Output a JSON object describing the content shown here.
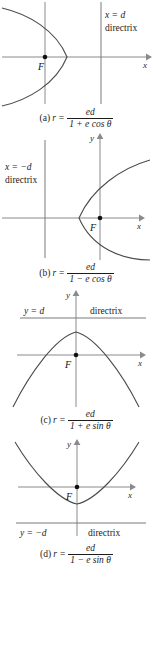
{
  "figure": {
    "axis_color": "#8a8a8a",
    "curve_color": "#4a4a4a",
    "directrix_color": "#7a7a7a",
    "focus_color": "#111111"
  },
  "panels": [
    {
      "id": "a",
      "caption_label": "(a)",
      "caption_var": "r",
      "caption_eq": "=",
      "numerator": "ed",
      "denominator_terms": [
        "1",
        "+",
        "e",
        "cos",
        "θ"
      ],
      "denominator_text": "1 + e cos θ",
      "directrix_label": "x = d",
      "directrix_word": "directrix",
      "focus_label": "F",
      "x_axis_label": "x",
      "y_axis_label": "",
      "curve_type": "parabola-opens-left"
    },
    {
      "id": "b",
      "caption_label": "(b)",
      "caption_var": "r",
      "caption_eq": "=",
      "numerator": "ed",
      "denominator_terms": [
        "1",
        "−",
        "e",
        "cos",
        "θ"
      ],
      "denominator_text": "1 − e cos θ",
      "directrix_label": "x = −d",
      "directrix_word": "directrix",
      "focus_label": "F",
      "x_axis_label": "x",
      "y_axis_label": "y",
      "curve_type": "parabola-opens-right"
    },
    {
      "id": "c",
      "caption_label": "(c)",
      "caption_var": "r",
      "caption_eq": "=",
      "numerator": "ed",
      "denominator_terms": [
        "1",
        "+",
        "e",
        "sin",
        "θ"
      ],
      "denominator_text": "1 + e sin θ",
      "directrix_label": "y = d",
      "directrix_word": "directrix",
      "focus_label": "F",
      "x_axis_label": "x",
      "y_axis_label": "y",
      "curve_type": "parabola-opens-down"
    },
    {
      "id": "d",
      "caption_label": "(d)",
      "caption_var": "r",
      "caption_eq": "=",
      "numerator": "ed",
      "denominator_terms": [
        "1",
        "−",
        "e",
        "sin",
        "θ"
      ],
      "denominator_text": "1 − e sin θ",
      "directrix_label": "y = −d",
      "directrix_word": "directrix",
      "focus_label": "F",
      "x_axis_label": "x",
      "y_axis_label": "y",
      "curve_type": "parabola-opens-up"
    }
  ]
}
